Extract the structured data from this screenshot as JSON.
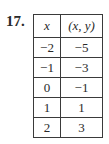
{
  "problem": {
    "number": "17."
  },
  "table": {
    "headers": [
      "x",
      "(x, y)"
    ],
    "rows": [
      {
        "x": "−2",
        "y": "−5"
      },
      {
        "x": "−1",
        "y": "−3"
      },
      {
        "x": "0",
        "y": "−1"
      },
      {
        "x": "1",
        "y": "1"
      },
      {
        "x": "2",
        "y": "3"
      }
    ]
  }
}
